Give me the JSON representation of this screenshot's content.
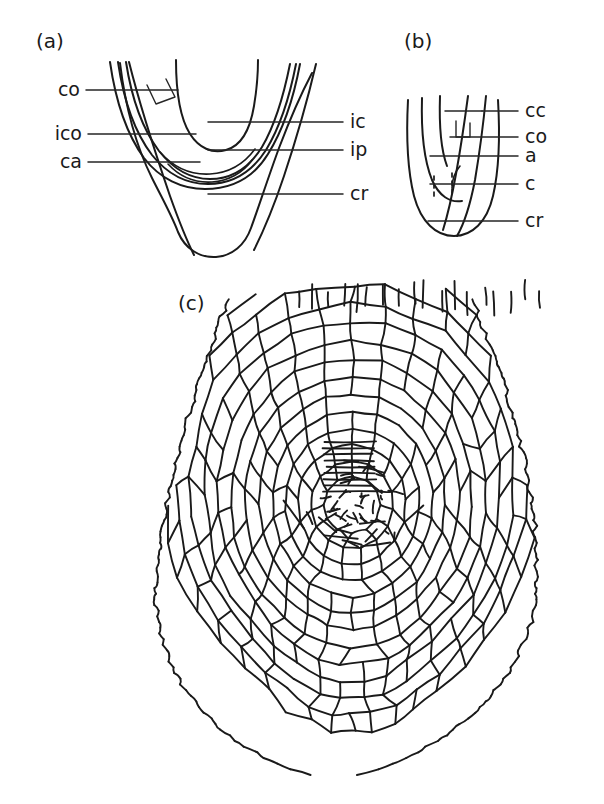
{
  "figure": {
    "type": "line-drawing",
    "background_color": "#ffffff",
    "ink_color": "#1a1a1a",
    "panels": [
      {
        "id": "a",
        "label": "(a)",
        "label_x": 36,
        "label_y": 48,
        "kind": "longitudinal-section-schematic",
        "left_labels": [
          {
            "text": "co",
            "x": 66,
            "y": 96,
            "leader_x1": 86,
            "leader_x2": 178,
            "leader_y": 90
          },
          {
            "text": "ico",
            "x": 56,
            "y": 140,
            "leader_x1": 88,
            "leader_x2": 196,
            "leader_y": 134
          },
          {
            "text": "ca",
            "x": 62,
            "y": 168,
            "leader_x1": 88,
            "leader_x2": 200,
            "leader_y": 162
          }
        ],
        "right_labels": [
          {
            "text": "ic",
            "x": 350,
            "y": 128,
            "leader_x1": 208,
            "leader_x2": 343,
            "leader_y": 122
          },
          {
            "text": "ip",
            "x": 350,
            "y": 156,
            "leader_x1": 208,
            "leader_x2": 343,
            "leader_y": 150
          },
          {
            "text": "cr",
            "x": 350,
            "y": 200,
            "leader_x1": 208,
            "leader_x2": 343,
            "leader_y": 194
          }
        ]
      },
      {
        "id": "b",
        "label": "(b)",
        "label_x": 404,
        "label_y": 48,
        "kind": "longitudinal-section-schematic",
        "right_labels": [
          {
            "text": "cc",
            "x": 525,
            "y": 117,
            "leader_x1": 482,
            "leader_x2": 518,
            "leader_y": 111
          },
          {
            "text": "co",
            "x": 525,
            "y": 143,
            "leader_x1": 482,
            "leader_x2": 518,
            "leader_y": 137
          },
          {
            "text": "a",
            "x": 525,
            "y": 162,
            "leader_x1": 470,
            "leader_x2": 518,
            "leader_y": 156
          },
          {
            "text": "c",
            "x": 525,
            "y": 190,
            "leader_x1": 470,
            "leader_x2": 518,
            "leader_y": 184
          },
          {
            "text": "cr",
            "x": 525,
            "y": 227,
            "leader_x1": 470,
            "leader_x2": 518,
            "leader_y": 221
          }
        ]
      },
      {
        "id": "c",
        "label": "(c)",
        "label_x": 178,
        "label_y": 310,
        "kind": "cell-pattern-map",
        "right_labels": [],
        "left_labels": []
      }
    ],
    "legend_keys": [
      "co",
      "ico",
      "ca",
      "ic",
      "ip",
      "cr",
      "cc",
      "a",
      "c"
    ]
  }
}
